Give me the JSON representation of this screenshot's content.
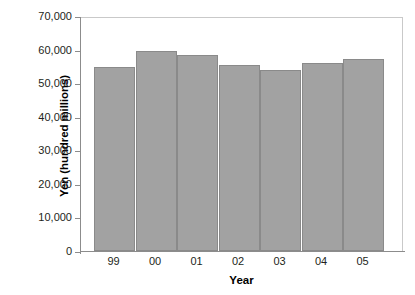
{
  "chart_data": {
    "type": "bar",
    "title": "",
    "subtitle": "",
    "xlabel": "Year",
    "ylabel": "Yen (hundred millions)",
    "categories": [
      "99",
      "00",
      "01",
      "02",
      "03",
      "04",
      "05"
    ],
    "values": [
      54800,
      59700,
      58300,
      55300,
      54000,
      55900,
      57300
    ],
    "series": [
      {
        "name": "Yen (hundred millions)",
        "values": [
          54800,
          59700,
          58300,
          55300,
          54000,
          55900,
          57300
        ]
      }
    ],
    "ylim": [
      0,
      70000
    ],
    "xlim_note": "categorical",
    "ytick_values": [
      0,
      10000,
      20000,
      30000,
      40000,
      50000,
      60000,
      70000
    ],
    "ytick_labels": [
      "0",
      "10,000",
      "20,000",
      "30,000",
      "40,000",
      "50,000",
      "60,000",
      "70,000"
    ],
    "xtick_labels": [
      "99",
      "00",
      "01",
      "02",
      "03",
      "04",
      "05"
    ],
    "grid": false,
    "legend": null,
    "legend_position": "none",
    "annotations": [],
    "colors": {
      "bar_fill": "#a2a2a2",
      "bar_stroke": "#8a8a8a",
      "axis": "#8c8c8c",
      "frame": "#c9c9c9",
      "text": "#231f20",
      "background": "#ffffff"
    }
  }
}
